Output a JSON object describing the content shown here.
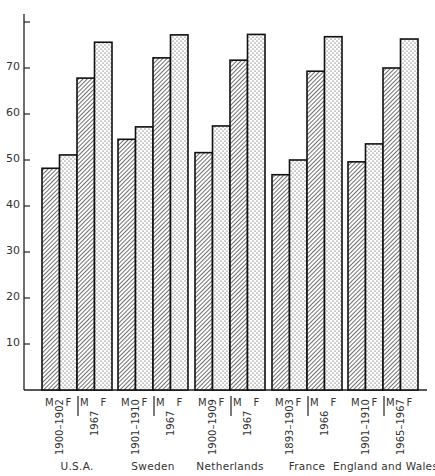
{
  "chart_data": {
    "type": "bar",
    "title": "",
    "xlabel": "",
    "ylabel": "",
    "ylim": [
      0,
      80
    ],
    "yticks": [
      10,
      20,
      30,
      40,
      50,
      60,
      70
    ],
    "grid": false,
    "legend": "none (M = male, hatched; F = female, dotted)",
    "categories": [
      "U.S.A. 1900-1902",
      "U.S.A. 1967",
      "Sweden 1901-1910",
      "Sweden 1967",
      "Netherlands 1900-1909",
      "Netherlands 1967",
      "France 1893-1903",
      "France 1966",
      "England and Wales 1901-1910",
      "England and Wales 1965-1967"
    ],
    "series": [
      {
        "name": "M",
        "pattern": "hatched",
        "values": [
          48.2,
          67.8,
          54.5,
          72.2,
          51.6,
          71.7,
          46.8,
          69.3,
          49.6,
          70.0
        ]
      },
      {
        "name": "F",
        "pattern": "dotted",
        "values": [
          51.1,
          75.6,
          57.2,
          77.2,
          57.4,
          77.3,
          50.0,
          76.8,
          53.5,
          76.3
        ]
      }
    ],
    "groups": [
      {
        "country": "U.S.A.",
        "periods": [
          "1900–1902",
          "1967"
        ]
      },
      {
        "country": "Sweden",
        "periods": [
          "1901–1910",
          "1967"
        ]
      },
      {
        "country": "Netherlands",
        "periods": [
          "1900–1909",
          "1967"
        ]
      },
      {
        "country": "France",
        "periods": [
          "1893–1903",
          "1966"
        ]
      },
      {
        "country": "England and Wales",
        "periods": [
          "1901–1910",
          "1965–1967"
        ]
      }
    ]
  },
  "labels": {
    "male": "M",
    "female": "F"
  },
  "colors": {
    "ink": "#1a1a1a",
    "background": "#ffffff"
  }
}
